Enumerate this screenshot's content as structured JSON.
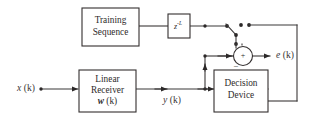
{
  "diagram": {
    "background_color": "#ffffff",
    "line_color": "#3b3838",
    "text_color": "#2e2b2b",
    "blocks": [
      {
        "id": "training-sequence",
        "line1": "Training",
        "line2": "Sequence"
      },
      {
        "id": "delay",
        "base": "z",
        "exponent": "-L"
      },
      {
        "id": "linear-receiver",
        "line1": "Linear",
        "line2": "Receiver",
        "line3_var": "w",
        "line3_arg": " (k)"
      },
      {
        "id": "decision-device",
        "line1": "Decision",
        "line2": "Device"
      }
    ],
    "signals": [
      {
        "id": "input",
        "var": "x",
        "arg": " (k)"
      },
      {
        "id": "receiver-output",
        "var": "y",
        "arg": " (k)"
      },
      {
        "id": "error",
        "var": "e",
        "arg": " (k)"
      }
    ],
    "summer": {
      "id": "summing-junction",
      "plus": "+",
      "minus": "_"
    },
    "switch": {
      "id": "mode-switch",
      "positions": 2
    }
  }
}
